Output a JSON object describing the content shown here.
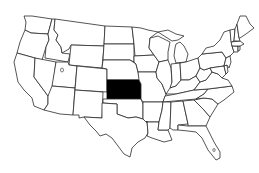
{
  "map": {
    "title": "United States",
    "type": "choropleth-locator",
    "highlighted_state": "Kansas",
    "colors": {
      "background": "#ffffff",
      "state_fill": "#ffffff",
      "border": "#2a2a2a",
      "highlight": "#000000"
    },
    "states": [
      "Washington",
      "Oregon",
      "California",
      "Idaho",
      "Nevada",
      "Montana",
      "Wyoming",
      "Utah",
      "Arizona",
      "Colorado",
      "New Mexico",
      "North Dakota",
      "South Dakota",
      "Nebraska",
      "Kansas",
      "Oklahoma",
      "Texas",
      "Minnesota",
      "Iowa",
      "Missouri",
      "Arkansas",
      "Louisiana",
      "Wisconsin",
      "Illinois",
      "Michigan",
      "Indiana",
      "Ohio",
      "Kentucky",
      "Tennessee",
      "Mississippi",
      "Alabama",
      "Georgia",
      "Florida",
      "South Carolina",
      "North Carolina",
      "Virginia",
      "West Virginia",
      "Pennsylvania",
      "New York",
      "Maryland",
      "Delaware",
      "New Jersey",
      "Connecticut",
      "Rhode Island",
      "Massachusetts",
      "Vermont",
      "New Hampshire",
      "Maine"
    ]
  }
}
